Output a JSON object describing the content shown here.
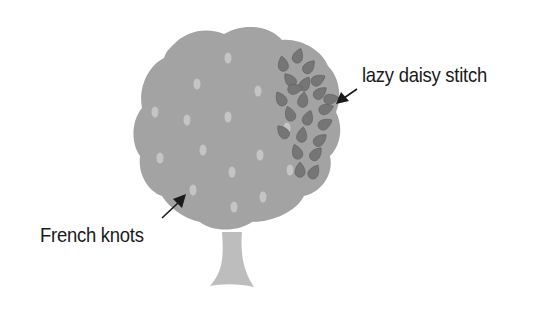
{
  "diagram": {
    "title": "",
    "labels": {
      "lazy_daisy": "lazy daisy stitch",
      "french_knots": "French knots"
    },
    "colors": {
      "background": "#ffffff",
      "canopy": "#a3a3a3",
      "trunk": "#bdbdbd",
      "knot": "#c4c4c4",
      "petal": "#767676",
      "petal_stroke": "#5e5e5e",
      "text": "#1a1a1a",
      "arrow": "#1a1a1a"
    },
    "knots": [
      [
        228,
        58
      ],
      [
        197,
        84
      ],
      [
        258,
        91
      ],
      [
        155,
        112
      ],
      [
        187,
        120
      ],
      [
        228,
        117
      ],
      [
        287,
        128
      ],
      [
        160,
        158
      ],
      [
        203,
        150
      ],
      [
        260,
        155
      ],
      [
        232,
        172
      ],
      [
        290,
        170
      ],
      [
        193,
        190
      ],
      [
        263,
        197
      ],
      [
        234,
        207
      ]
    ],
    "petals": [
      [
        283,
        64,
        -10
      ],
      [
        298,
        56,
        20
      ],
      [
        309,
        67,
        40
      ],
      [
        290,
        80,
        -40
      ],
      [
        305,
        84,
        30
      ],
      [
        318,
        80,
        60
      ],
      [
        281,
        99,
        -30
      ],
      [
        303,
        100,
        10
      ],
      [
        320,
        93,
        50
      ],
      [
        326,
        109,
        70
      ],
      [
        290,
        114,
        -20
      ],
      [
        308,
        118,
        20
      ],
      [
        325,
        124,
        60
      ],
      [
        283,
        132,
        -40
      ],
      [
        302,
        135,
        10
      ],
      [
        320,
        140,
        50
      ],
      [
        297,
        152,
        -20
      ],
      [
        316,
        154,
        40
      ],
      [
        300,
        170,
        0
      ],
      [
        314,
        172,
        30
      ],
      [
        295,
        89,
        80
      ],
      [
        331,
        99,
        80
      ]
    ]
  }
}
